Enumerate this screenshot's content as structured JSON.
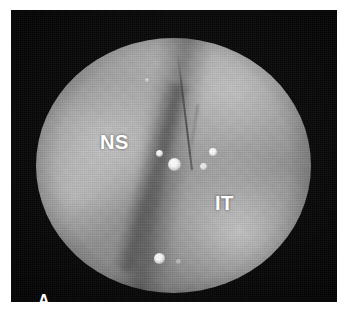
{
  "figure": {
    "panel_letter": "A",
    "modality": "grayscale-photograph",
    "frame": {
      "background_color": "#0a0a0a",
      "page_background_color": "#ffffff"
    },
    "field": {
      "shape": "circle",
      "base_color": "#909090",
      "rim_color": "#000000",
      "bright_zones": [
        "upper-left (NS lobe)",
        "upper-right",
        "lower-right",
        "left-mid"
      ]
    },
    "labels": [
      {
        "text": "NS",
        "name": "nasal-superior-label",
        "color": "#ffffff",
        "x": 100,
        "y": 132
      },
      {
        "text": "IT",
        "name": "inferior-temporal-label",
        "color": "#ffffff",
        "x": 215,
        "y": 193
      }
    ],
    "specular_highlights": [
      {
        "name": "specular-center-bright",
        "x": 50.5,
        "y": 50.0,
        "size": 13
      },
      {
        "name": "specular-center-small",
        "x": 45.5,
        "y": 46.5,
        "size": 7
      },
      {
        "name": "specular-right-upper",
        "x": 64.5,
        "y": 45.5,
        "size": 8
      },
      {
        "name": "specular-right-lower",
        "x": 61.0,
        "y": 51.5,
        "size": 7
      },
      {
        "name": "specular-lower-center",
        "x": 45.0,
        "y": 86.5,
        "size": 11
      },
      {
        "name": "specular-lower-faint",
        "x": 52.0,
        "y": 88.0,
        "size": 5
      },
      {
        "name": "specular-upper-faint",
        "x": 41.5,
        "y": 17.0,
        "size": 4
      }
    ],
    "features": [
      {
        "name": "vessel-main",
        "type": "vessel"
      },
      {
        "name": "vessel-branch",
        "type": "vessel"
      },
      {
        "name": "shadow-band",
        "type": "shadow-fold"
      }
    ]
  }
}
